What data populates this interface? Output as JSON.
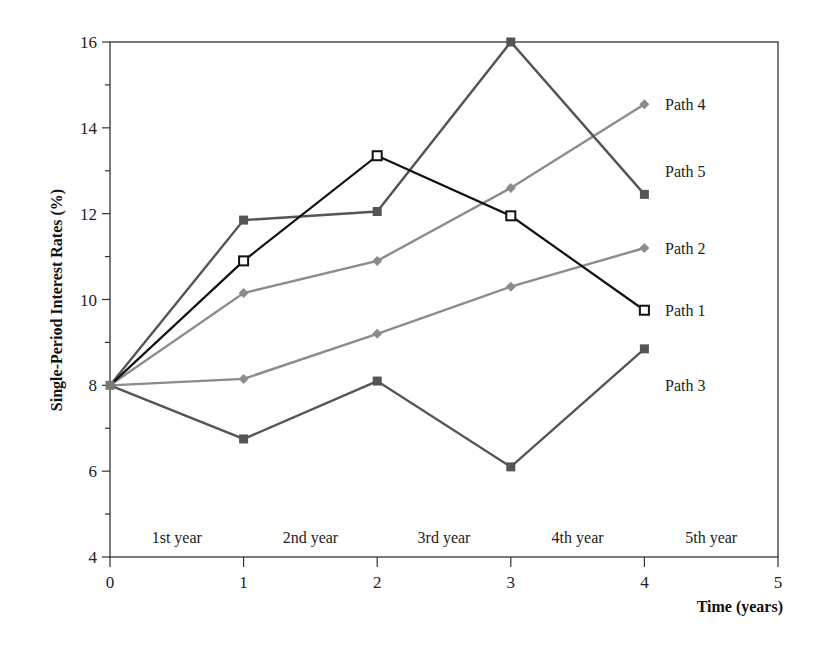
{
  "chart_data": {
    "type": "line",
    "title": "",
    "xlabel": "Time (years)",
    "ylabel": "Single-Period Interest Rates (%)",
    "x": [
      0,
      1,
      2,
      3,
      4
    ],
    "xlim": [
      0,
      5
    ],
    "ylim": [
      4,
      16
    ],
    "xticks": [
      "0",
      "1",
      "2",
      "3",
      "4",
      "5"
    ],
    "yticks": [
      "4",
      "6",
      "8",
      "10",
      "12",
      "14",
      "16"
    ],
    "grid": false,
    "legend_position": "inline-right",
    "period_labels": [
      "1st year",
      "2nd year",
      "3rd year",
      "4th year",
      "5th year"
    ],
    "series": [
      {
        "name": "Path 4",
        "values": [
          8,
          10.15,
          10.9,
          12.6,
          14.55
        ],
        "color": "#8c8c8c",
        "marker": "diamond",
        "label_y": 14.55
      },
      {
        "name": "Path 5",
        "values": [
          8,
          11.85,
          12.05,
          16.0,
          12.45
        ],
        "color": "#555555",
        "marker": "square-filled",
        "label_y": 13.0
      },
      {
        "name": "Path 2",
        "values": [
          8,
          8.15,
          9.2,
          10.3,
          11.2
        ],
        "color": "#8c8c8c",
        "marker": "diamond",
        "label_y": 11.2
      },
      {
        "name": "Path 1",
        "values": [
          8,
          10.9,
          13.35,
          11.95,
          9.75
        ],
        "color": "#111111",
        "marker": "square-open",
        "label_y": 9.75
      },
      {
        "name": "Path 3",
        "values": [
          8,
          6.75,
          8.1,
          6.1,
          8.85
        ],
        "color": "#555555",
        "marker": "square-filled",
        "label_y": 8.0
      }
    ]
  }
}
